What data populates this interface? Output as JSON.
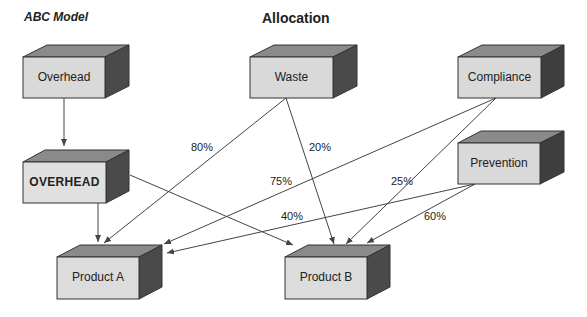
{
  "header": {
    "left_title": "ABC Model",
    "center_title": "Allocation"
  },
  "colors": {
    "front_face": "#d9d9d9",
    "top_face": "#8a8a8a",
    "side_face": "#4a4a4a",
    "edge": "#333333",
    "line": "#444444"
  },
  "nodes": [
    {
      "id": "overhead",
      "label": "Overhead"
    },
    {
      "id": "waste",
      "label": "Waste"
    },
    {
      "id": "compliance",
      "label": "Compliance"
    },
    {
      "id": "overhead-pool",
      "label": "OVERHEAD"
    },
    {
      "id": "prevention",
      "label": "Prevention"
    },
    {
      "id": "product-a",
      "label": "Product A"
    },
    {
      "id": "product-b",
      "label": "Product B"
    }
  ],
  "edges": [
    {
      "from": "Overhead",
      "to": "OVERHEAD",
      "label": ""
    },
    {
      "from": "OVERHEAD",
      "to": "Product A",
      "label": ""
    },
    {
      "from": "OVERHEAD",
      "to": "Product B",
      "label": ""
    },
    {
      "from": "Waste",
      "to": "Product A",
      "label": "80%"
    },
    {
      "from": "Waste",
      "to": "Product B",
      "label": "20%"
    },
    {
      "from": "Compliance",
      "to": "Product A",
      "label": "75%"
    },
    {
      "from": "Compliance",
      "to": "Product B",
      "label": "25%"
    },
    {
      "from": "Prevention",
      "to": "Product A",
      "label": "40%"
    },
    {
      "from": "Prevention",
      "to": "Product B",
      "label": "60%"
    }
  ]
}
